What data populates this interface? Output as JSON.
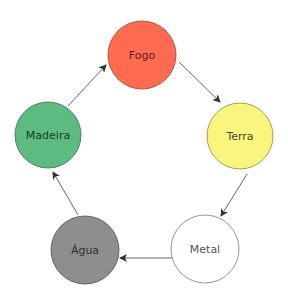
{
  "diagram": {
    "type": "cycle",
    "nodes": [
      {
        "id": "fogo",
        "label": "Fogo",
        "cx": 142,
        "cy": 55,
        "r": 34,
        "fill": "#FF6B50",
        "stroke": "#B04A3A",
        "text_color": "#5A1E14"
      },
      {
        "id": "terra",
        "label": "Terra",
        "cx": 240,
        "cy": 136,
        "r": 33,
        "fill": "#F9F57E",
        "stroke": "#9A9640",
        "text_color": "#4A4A2A"
      },
      {
        "id": "metal",
        "label": "Metal",
        "cx": 205,
        "cy": 249,
        "r": 34,
        "fill": "#FFFFFF",
        "stroke": "#8A8A8A",
        "text_color": "#555555"
      },
      {
        "id": "agua",
        "label": "Água",
        "cx": 85,
        "cy": 250,
        "r": 34,
        "fill": "#8E8E8E",
        "stroke": "#5A5A5A",
        "text_color": "#2E2E2E"
      },
      {
        "id": "madeira",
        "label": "Madeira",
        "cx": 48,
        "cy": 135,
        "r": 33,
        "fill": "#5DBB82",
        "stroke": "#3A7A52",
        "text_color": "#1C3A28"
      }
    ],
    "edges": [
      {
        "from": "madeira",
        "to": "fogo",
        "x1": 68,
        "y1": 106,
        "x2": 106,
        "y2": 65
      },
      {
        "from": "fogo",
        "to": "terra",
        "x1": 179,
        "y1": 62,
        "x2": 220,
        "y2": 102
      },
      {
        "from": "terra",
        "to": "metal",
        "x1": 247,
        "y1": 174,
        "x2": 221,
        "y2": 216
      },
      {
        "from": "metal",
        "to": "agua",
        "x1": 172,
        "y1": 258,
        "x2": 120,
        "y2": 258
      },
      {
        "from": "agua",
        "to": "madeira",
        "x1": 78,
        "y1": 215,
        "x2": 53,
        "y2": 172
      }
    ],
    "edge_color": "#555555"
  }
}
